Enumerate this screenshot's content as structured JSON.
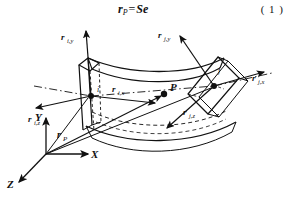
{
  "figure": {
    "caption_equation": {
      "lhs_symbol": "r",
      "lhs_sub": "P",
      "operator": "=",
      "rhs": "Se",
      "full": "r_P = Se"
    },
    "equation_number": "( 1 )",
    "global_axes": {
      "x_label": "X",
      "y_label": "Y",
      "z_label": "Z"
    },
    "position_vector": {
      "symbol": "r",
      "sub": "P",
      "full": "r_P"
    },
    "point": {
      "label": "P"
    },
    "node_i": {
      "id": "i",
      "directors": [
        {
          "symbol": "r",
          "sub": "i,y",
          "full": "r_i,y"
        },
        {
          "symbol": "r",
          "sub": "i,x",
          "full": "r_i,x"
        },
        {
          "symbol": "r",
          "sub": "i,z",
          "full": "r_i,z"
        }
      ]
    },
    "node_j": {
      "id": "j",
      "directors": [
        {
          "symbol": "r",
          "sub": "j,y",
          "full": "r_j,y"
        },
        {
          "symbol": "r",
          "sub": "j,x",
          "full": "r_j,x"
        },
        {
          "symbol": "r",
          "sub": "j,z",
          "full": "r_j,z"
        }
      ]
    },
    "colors": {
      "ink": "#111111",
      "background": "#ffffff"
    }
  }
}
